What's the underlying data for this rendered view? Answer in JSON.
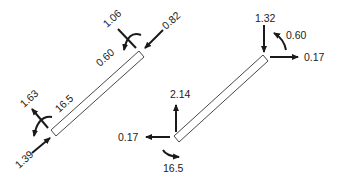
{
  "diagram": {
    "type": "free-body diagrams of inclined members",
    "left_member": {
      "axial_label": "16.5",
      "shear_label": "0.60",
      "top_end": {
        "force_along_member": "0.82",
        "perpendicular_force": "1.06"
      },
      "bottom_end": {
        "force_along_member": "1.39",
        "perpendicular_force": "1.63"
      }
    },
    "right_member": {
      "top_end": {
        "vertical_force": "1.32",
        "moment": "0.60",
        "horizontal_force": "0.17"
      },
      "bottom_end": {
        "vertical_force": "2.14",
        "horizontal_force": "0.17",
        "moment": "16.5"
      }
    }
  }
}
